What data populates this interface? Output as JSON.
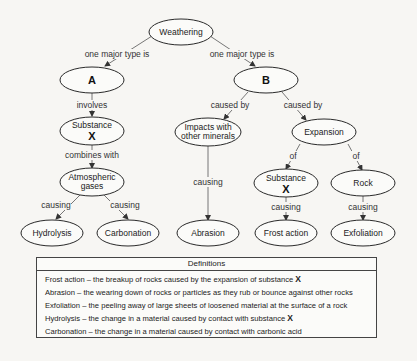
{
  "diagram": {
    "nodes": {
      "weathering": {
        "label": "Weathering"
      },
      "a": {
        "label": "A"
      },
      "b": {
        "label": "B"
      },
      "substance_x_left": {
        "label": "Substance",
        "symbol": "X"
      },
      "atmospheric_gases": {
        "line1": "Atmospheric",
        "line2": "gases"
      },
      "hydrolysis": {
        "label": "Hydrolysis"
      },
      "carbonation": {
        "label": "Carbonation"
      },
      "impacts": {
        "line1": "Impacts with",
        "line2": "other minerals"
      },
      "expansion": {
        "label": "Expansion"
      },
      "abrasion": {
        "label": "Abrasion"
      },
      "substance_x_right": {
        "label": "Substance",
        "symbol": "X"
      },
      "rock": {
        "label": "Rock"
      },
      "frost_action": {
        "label": "Frost action"
      },
      "exfoliation": {
        "label": "Exfoliation"
      }
    },
    "edges": {
      "weathering_a": "one major type is",
      "weathering_b": "one major type is",
      "a_substance": "involves",
      "substance_gases": "combines with",
      "gases_hydrolysis": "causing",
      "gases_carbonation": "causing",
      "b_impacts": "caused by",
      "b_expansion": "caused by",
      "impacts_abrasion": "causing",
      "expansion_substance": "of",
      "expansion_rock": "of",
      "substance_frost": "causing",
      "rock_exfoliation": "causing"
    }
  },
  "definitions": {
    "title": "Definitions",
    "items": [
      {
        "term": "Frost action",
        "text": " – the breakup of rocks caused by the expansion of substance ",
        "symbol": "X"
      },
      {
        "term": "Abrasion",
        "text": " – the wearing down of rocks or particles as they rub or bounce against other rocks",
        "symbol": ""
      },
      {
        "term": "Exfoliation",
        "text": " – the peeling away of large sheets of loosened material at the surface of a rock",
        "symbol": ""
      },
      {
        "term": "Hydrolysis",
        "text": " – the change in a material caused by contact with substance ",
        "symbol": "X"
      },
      {
        "term": "Carbonation",
        "text": " – the change in a material caused by contact with carbonic acid",
        "symbol": ""
      }
    ]
  }
}
